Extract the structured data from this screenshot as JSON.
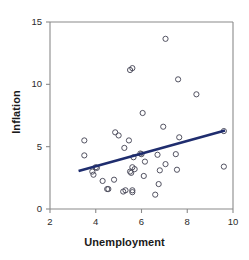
{
  "chart_data": {
    "type": "scatter",
    "title": "",
    "xlabel": "Unemployment",
    "ylabel": "Inflation",
    "xlim": [
      2,
      10
    ],
    "ylim": [
      0,
      15
    ],
    "xticks": [
      2,
      4,
      6,
      8,
      10
    ],
    "yticks": [
      0,
      5,
      10,
      15
    ],
    "xtick_labels": [
      "2",
      "4",
      "6",
      "8",
      "10"
    ],
    "ytick_labels": [
      "0",
      "5",
      "10",
      "15"
    ],
    "grid": false,
    "legend": null,
    "marker": {
      "shape": "open-circle",
      "edge_color": "#4a4a5a",
      "fill": "none",
      "radius_px": 2.6
    },
    "axis_color": "#8a8a8a",
    "series": [
      {
        "name": "countries",
        "points": [
          [
            3.5,
            5.5
          ],
          [
            3.5,
            4.3
          ],
          [
            3.85,
            3.0
          ],
          [
            3.9,
            2.75
          ],
          [
            4.0,
            3.35
          ],
          [
            4.05,
            3.3
          ],
          [
            4.3,
            2.25
          ],
          [
            4.5,
            1.6
          ],
          [
            4.55,
            1.6
          ],
          [
            4.85,
            6.15
          ],
          [
            4.8,
            2.35
          ],
          [
            5.0,
            5.9
          ],
          [
            5.2,
            1.4
          ],
          [
            5.25,
            4.9
          ],
          [
            5.3,
            1.5
          ],
          [
            5.45,
            5.5
          ],
          [
            5.5,
            11.15
          ],
          [
            5.5,
            3.0
          ],
          [
            5.55,
            2.9
          ],
          [
            5.6,
            11.3
          ],
          [
            5.6,
            3.35
          ],
          [
            5.6,
            1.35
          ],
          [
            5.6,
            1.5
          ],
          [
            5.65,
            4.15
          ],
          [
            5.7,
            3.2
          ],
          [
            5.95,
            4.45
          ],
          [
            6.0,
            4.4
          ],
          [
            6.05,
            7.7
          ],
          [
            6.1,
            2.65
          ],
          [
            6.15,
            3.8
          ],
          [
            6.6,
            1.15
          ],
          [
            6.7,
            4.35
          ],
          [
            6.75,
            2.0
          ],
          [
            6.8,
            3.1
          ],
          [
            6.95,
            6.6
          ],
          [
            7.05,
            13.65
          ],
          [
            7.05,
            3.6
          ],
          [
            7.5,
            4.4
          ],
          [
            7.55,
            3.15
          ],
          [
            7.6,
            10.4
          ],
          [
            7.65,
            5.75
          ],
          [
            8.4,
            9.2
          ],
          [
            9.6,
            6.25
          ],
          [
            9.6,
            3.4
          ]
        ]
      }
    ],
    "trend_line": {
      "name": "regression-line",
      "color": "#1f2d6e",
      "width_px": 2.6,
      "x_start": 3.25,
      "y_start": 3.05,
      "x_end": 9.65,
      "y_end": 6.3
    }
  }
}
